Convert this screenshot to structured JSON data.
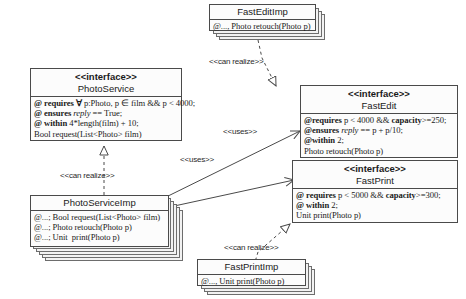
{
  "diagram": {
    "kind": "uml-class-diagram",
    "stroke_color": "#4a4a4a",
    "box_fill": "#fcfcfc",
    "stack_fill": "#f2f2f2"
  },
  "boxes": {
    "fast_edit_imp": {
      "name": "FastEditImp",
      "stereotype": "",
      "members": [
        "@..., Photo retouch(Photo p)"
      ]
    },
    "photo_service": {
      "stereotype": "<<interface>>",
      "name": "PhotoService",
      "members": [
        "@ requires ∀ p:Photo, p ∈ film && p < 4000;",
        "@ ensures reply == True;",
        "@ within 4*length(film) + 10;",
        "Bool request(List<Photo> film)"
      ]
    },
    "fast_edit": {
      "stereotype": "<<interface>>",
      "name": "FastEdit",
      "members": [
        "@requires p < 4000 && capacity>=250;",
        "@ensures reply == p + p/10;",
        "@within 2;",
        "Photo retouch(Photo p)"
      ]
    },
    "fast_print": {
      "stereotype": "<<interface>>",
      "name": "FastPrint",
      "members": [
        "@ requires p < 5000 && capacity>=300;",
        "@ within 2;",
        "Unit print(Photo p)"
      ]
    },
    "photo_service_imp": {
      "stereotype": "",
      "name": "PhotoServiceImp",
      "members": [
        "@...; Bool request(List<Photo> film)",
        "@...; Photo retouch(Photo p)",
        "@...; Unit  print(Photo p)"
      ]
    },
    "fast_print_imp": {
      "stereotype": "",
      "name": "FastPrintImp",
      "members": [
        "@..., Unit print(Photo p)"
      ]
    }
  },
  "connectors": {
    "can_realize_top": {
      "label": "<<can realize>>",
      "type": "realization"
    },
    "can_realize_left": {
      "label": "<<can realize>>",
      "type": "realization"
    },
    "can_realize_bottom": {
      "label": "<<can realize>>",
      "type": "realization"
    },
    "uses_edit": {
      "label": "<<uses>>",
      "type": "dependency"
    },
    "uses_print": {
      "label": "<<uses>>",
      "type": "dependency"
    }
  }
}
